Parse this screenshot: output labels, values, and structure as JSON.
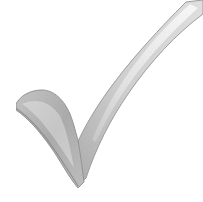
{
  "image": {
    "subject": "checkmark",
    "icon": "checkmark-icon",
    "description": "3D grayscale check mark",
    "colors": {
      "background": "#ffffff",
      "highlight": "#f2f2f2",
      "light": "#d9d9d9",
      "mid": "#b5b5b5",
      "dark": "#8a8a8a",
      "edge": "#6e6e6e"
    }
  }
}
